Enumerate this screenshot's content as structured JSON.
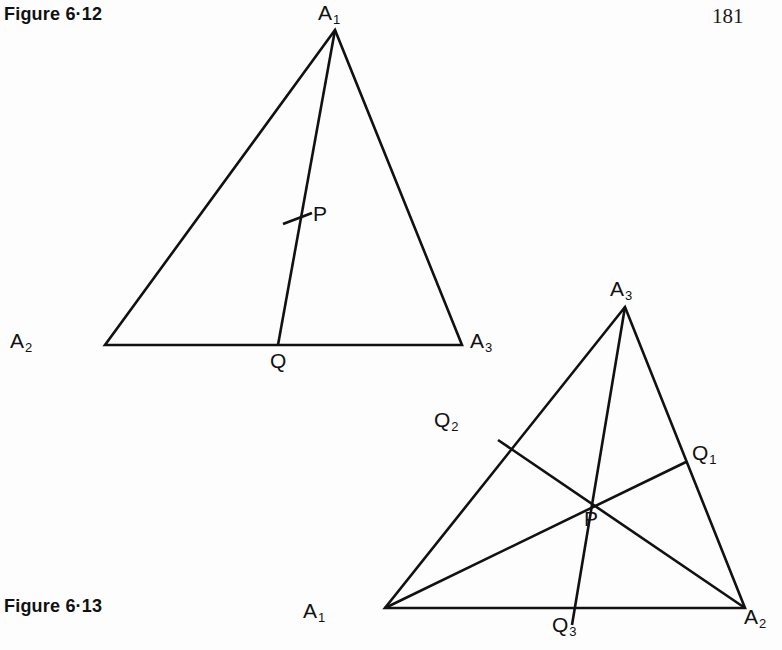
{
  "page": {
    "number": "181",
    "background_color": "#fdfdfd",
    "ink_color": "#111111"
  },
  "captions": {
    "top": "Figure 6·12",
    "bottom": "Figure 6·13"
  },
  "figures": [
    {
      "id": "figure-6-12",
      "caption": "Figure 6·12",
      "description": "Triangle A1A2A3 with a single cevian from A1 to Q on side A2A3, marked with a tick at point P",
      "vertices": [
        {
          "name": "A",
          "sub": "1",
          "label": "A₁",
          "x": 335,
          "y": 30,
          "label_x": 318,
          "label_y": 2
        },
        {
          "name": "A",
          "sub": "2",
          "label": "A₂",
          "x": 105,
          "y": 345,
          "label_x": 10,
          "label_y": 330
        },
        {
          "name": "A",
          "sub": "3",
          "label": "A₃",
          "x": 462,
          "y": 345,
          "label_x": 470,
          "label_y": 330
        }
      ],
      "points": [
        {
          "name": "Q",
          "sub": "",
          "label": "Q",
          "x": 278,
          "y": 345,
          "label_x": 270,
          "label_y": 350
        },
        {
          "name": "P",
          "sub": "",
          "label": "P",
          "x": 300,
          "y": 218,
          "label_x": 313,
          "label_y": 203
        }
      ],
      "edges": [
        {
          "from": "A1",
          "to": "A2"
        },
        {
          "from": "A2",
          "to": "A3"
        },
        {
          "from": "A3",
          "to": "A1"
        }
      ],
      "cevians": [
        {
          "from": "A1",
          "to": "Q"
        }
      ],
      "tick_marks": [
        {
          "on": "A1Q",
          "at": "P",
          "x": 297,
          "y": 219
        }
      ]
    },
    {
      "id": "figure-6-13",
      "caption": "Figure 6·13",
      "description": "Triangle A1A2A3 with three concurrent cevians A1Q1, A2Q2, A3Q3 meeting at P",
      "vertices": [
        {
          "name": "A",
          "sub": "3",
          "label": "A₃",
          "x": 625,
          "y": 307,
          "label_x": 610,
          "label_y": 278
        },
        {
          "name": "A",
          "sub": "1",
          "label": "A₁",
          "x": 385,
          "y": 608,
          "label_x": 303,
          "label_y": 600
        },
        {
          "name": "A",
          "sub": "2",
          "label": "A₂",
          "x": 745,
          "y": 608,
          "label_x": 744,
          "label_y": 606
        }
      ],
      "points": [
        {
          "name": "Q",
          "sub": "2",
          "label": "Q₂",
          "x": 498,
          "y": 440,
          "label_x": 434,
          "label_y": 409
        },
        {
          "name": "Q",
          "sub": "1",
          "label": "Q₁",
          "x": 686,
          "y": 462,
          "label_x": 692,
          "label_y": 442
        },
        {
          "name": "Q",
          "sub": "3",
          "label": "Q₃",
          "x": 572,
          "y": 608,
          "label_x": 552,
          "label_y": 614
        },
        {
          "name": "P",
          "sub": "",
          "label": "P",
          "x": 588,
          "y": 505,
          "label_x": 584,
          "label_y": 508
        }
      ],
      "edges": [
        {
          "from": "A3",
          "to": "A1"
        },
        {
          "from": "A1",
          "to": "A2"
        },
        {
          "from": "A2",
          "to": "A3"
        }
      ],
      "cevians": [
        {
          "from": "A1",
          "to": "Q1"
        },
        {
          "from": "A2",
          "to": "Q2"
        },
        {
          "from": "A3",
          "to": "Q3"
        }
      ],
      "tick_marks": []
    }
  ],
  "geometry": {
    "stroke_width": 2.6,
    "tick_length": 19
  }
}
